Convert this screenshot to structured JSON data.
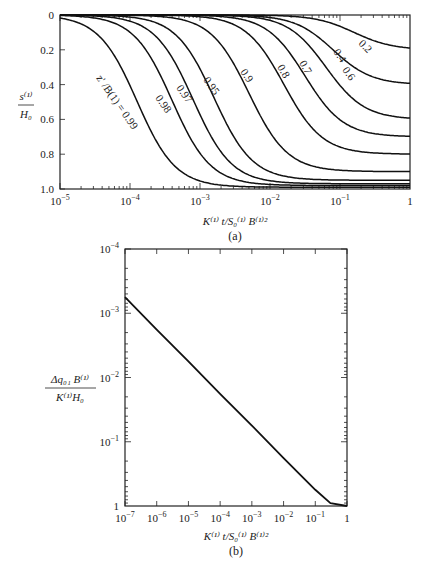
{
  "chart_data": [
    {
      "type": "line",
      "panel": "(a)",
      "xscale": "log",
      "xlim": [
        1e-05,
        1
      ],
      "ylim": [
        0,
        1.0
      ],
      "y_inverted": true,
      "xlabel": "K(1) t / S0(1) B(1)2",
      "ylabel": "s(1) / H0",
      "xticks": [
        "10^-5",
        "10^-4",
        "10^-3",
        "10^-2",
        "10^-1",
        "1"
      ],
      "yticks": [
        "0",
        "0.2",
        "0.4",
        "0.6",
        "0.8",
        "1.0"
      ],
      "curve_param_label": "z' / B(1)",
      "series": [
        {
          "name": "0.99",
          "asymptote": 0.99,
          "x_mid_log": -3.9
        },
        {
          "name": "0.98",
          "asymptote": 0.98,
          "x_mid_log": -3.4
        },
        {
          "name": "0.97",
          "asymptote": 0.97,
          "x_mid_log": -3.1
        },
        {
          "name": "0.95",
          "asymptote": 0.95,
          "x_mid_log": -2.8
        },
        {
          "name": "0.9",
          "asymptote": 0.9,
          "x_mid_log": -2.3
        },
        {
          "name": "0.8",
          "asymptote": 0.8,
          "x_mid_log": -1.8
        },
        {
          "name": "0.7",
          "asymptote": 0.7,
          "x_mid_log": -1.5
        },
        {
          "name": "0.6",
          "asymptote": 0.6,
          "x_mid_log": -1.2
        },
        {
          "name": "0.4",
          "asymptote": 0.4,
          "x_mid_log": -1.1
        },
        {
          "name": "0.2",
          "asymptote": 0.2,
          "x_mid_log": -0.8
        }
      ]
    },
    {
      "type": "line",
      "panel": "(b)",
      "xscale": "log",
      "yscale": "log",
      "xlim": [
        1e-07,
        1
      ],
      "ylim": [
        0.0001,
        1
      ],
      "y_inverted": true,
      "xlabel": "K(1) t / S0(1) B(1)2",
      "ylabel": "Δq01 B(1) / K(1) H0",
      "xticks": [
        "10^-7",
        "10^-6",
        "10^-5",
        "10^-4",
        "10^-3",
        "10^-2",
        "10^-1",
        "1"
      ],
      "yticks": [
        "10^-4",
        "10^-3",
        "10^-2",
        "10^-1",
        "1"
      ],
      "series": [
        {
          "name": "flow",
          "x": [
            1e-07,
            1e-06,
            1e-05,
            0.0001,
            0.001,
            0.01,
            0.1,
            0.3,
            1
          ],
          "y": [
            0.00056,
            0.0018,
            0.0056,
            0.018,
            0.056,
            0.18,
            0.56,
            0.9,
            1.0
          ]
        }
      ]
    }
  ],
  "panel_a": {
    "caption": "(a)",
    "xlabel": {
      "k": "K",
      "sup1": "(1)",
      "t": "t/S",
      "sub0": "0",
      "sup2": "(1)",
      "b": "B",
      "sup3": "(1)2"
    },
    "ylabel_num": "s",
    "ylabel_num_sup": "(1)",
    "ylabel_den": "H",
    "ylabel_den_sub": "0",
    "param_label": "z' /B(1) = 0.99"
  },
  "panel_b": {
    "caption": "(b)",
    "ylabel_num": "Δq₀₁ B⁽¹⁾",
    "ylabel_den": "K⁽¹⁾H₀"
  }
}
